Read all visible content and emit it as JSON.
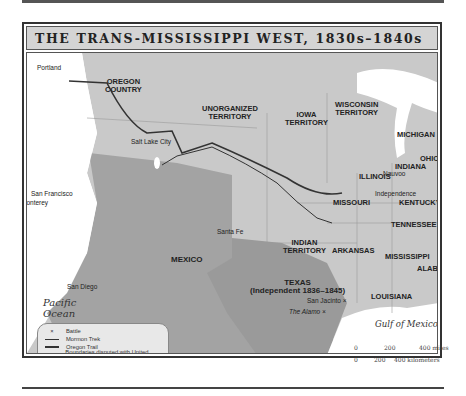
{
  "title": "THE TRANS-MISSISSIPPI WEST, 1830s–1840s",
  "regions": {
    "oregon_country": [
      "OREGON",
      "COUNTRY"
    ],
    "unorganized_territory": [
      "UNORGANIZED",
      "TERRITORY"
    ],
    "iowa_territory": [
      "IOWA",
      "TERRITORY"
    ],
    "wisconsin_territory": [
      "WISCONSIN",
      "TERRITORY"
    ],
    "michigan": "MICHIGAN",
    "ohio": "OHIO",
    "indiana": "INDIANA",
    "illinois": "ILLINOIS",
    "missouri": "MISSOURI",
    "kentucky": "KENTUCKY",
    "tennessee": "TENNESSEE",
    "indian_territory": [
      "INDIAN",
      "TERRITORY"
    ],
    "arkansas": "ARKANSAS",
    "mississippi": "MISSISSIPPI",
    "alabama": "ALABAMA",
    "louisiana": "LOUISIANA",
    "mexico": "MEXICO",
    "texas": [
      "TEXAS",
      "(Independent 1836–1845)"
    ]
  },
  "cities": {
    "portland": "Portland",
    "salt_lake_city": "Salt Lake City",
    "nauvoo": "Nauvoo",
    "independence": "Independence",
    "san_francisco": "San Francisco",
    "monterey": "Monterey",
    "santa_fe": "Santa Fe",
    "san_diego": "San Diego"
  },
  "battles": {
    "san_jacinto": "San Jacinto",
    "the_alamo": "The Alamo"
  },
  "water": {
    "pacific": [
      "Pacific",
      "Ocean"
    ],
    "gulf": "Gulf of Mexico"
  },
  "legend": {
    "items": [
      {
        "symbol": "×",
        "label": "Battle"
      },
      {
        "symbol": "line-thin",
        "label": "Mormon Trek"
      },
      {
        "symbol": "line-thick",
        "label": "Oregon Trail"
      },
      {
        "symbol": "line-dotted",
        "label": "Boundaries disputed with United States"
      },
      {
        "symbol": "swatch",
        "label": "Mexico after independence from Spain, 1821"
      }
    ]
  },
  "scale": {
    "miles": [
      "0",
      "200",
      "400 miles"
    ],
    "kilometers": [
      "0",
      "200",
      "400 kilometers"
    ]
  },
  "colors": {
    "us_land": "#c9c9c9",
    "mexico_land": "#a3a3a3",
    "water": "#ffffff",
    "trail": "#333333",
    "title_bar": "#d4d4d4"
  }
}
